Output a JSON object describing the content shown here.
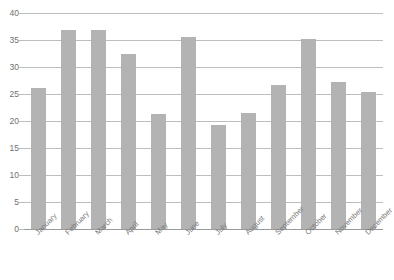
{
  "chart_data": {
    "type": "bar",
    "title": "",
    "xlabel": "",
    "ylabel": "",
    "ylim": [
      0,
      40
    ],
    "yticks": [
      0,
      5,
      10,
      15,
      20,
      25,
      30,
      35,
      40
    ],
    "grid": true,
    "legend": false,
    "bar_color": "#b3b3b3",
    "grid_color": "#bdbdbd",
    "axis_color": "#9a9a9a",
    "categories": [
      "January",
      "February",
      "March",
      "April",
      "May",
      "June",
      "July",
      "August",
      "September",
      "October",
      "November",
      "December"
    ],
    "values": [
      26.1,
      36.8,
      36.9,
      32.4,
      21.3,
      35.6,
      19.3,
      21.5,
      26.6,
      35.2,
      27.2,
      25.3
    ]
  },
  "axis": {
    "y_labels": [
      "40",
      "35",
      "30",
      "25",
      "20",
      "15",
      "10",
      "5",
      "0"
    ]
  },
  "header": {
    "clipped_title": ""
  }
}
